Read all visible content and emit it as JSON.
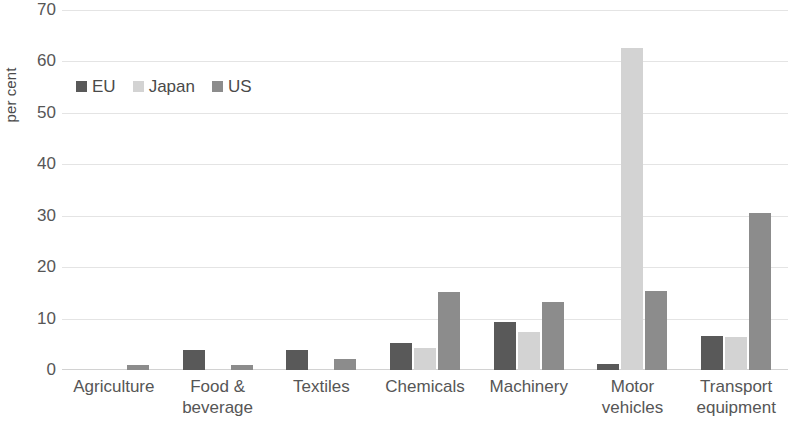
{
  "chart_data": {
    "type": "bar",
    "title": "",
    "subtitle": "",
    "xlabel": "",
    "ylabel": "per cent",
    "ylim": [
      0,
      70
    ],
    "ytick_values": [
      70,
      60,
      50,
      40,
      30,
      20,
      10,
      0
    ],
    "ytick_labels": [
      "70",
      "60",
      "50",
      "40",
      "30",
      "20",
      "10",
      "0"
    ],
    "grid": true,
    "grid_axis": "y",
    "legend_position": "top-left",
    "categories": [
      "Agriculture",
      "Food &\nbeverage",
      "Textiles",
      "Chemicals",
      "Machinery",
      "Motor\nvehicles",
      "Transport\nequipment"
    ],
    "category_lines": [
      [
        "Agriculture"
      ],
      [
        "Food &",
        "beverage"
      ],
      [
        "Textiles"
      ],
      [
        "Chemicals"
      ],
      [
        "Machinery"
      ],
      [
        "Motor",
        "vehicles"
      ],
      [
        "Transport",
        "equipment"
      ]
    ],
    "series": [
      {
        "name": "EU",
        "color": "#595959",
        "values": [
          0.0,
          3.9,
          3.9,
          5.3,
          9.4,
          1.2,
          6.6
        ]
      },
      {
        "name": "Japan",
        "color": "#d3d3d3",
        "values": [
          0.0,
          0.0,
          0.0,
          4.3,
          7.3,
          62.7,
          6.4
        ]
      },
      {
        "name": "US",
        "color": "#8c8c8c",
        "values": [
          1.0,
          1.0,
          2.1,
          15.1,
          13.3,
          15.3,
          30.6
        ]
      }
    ]
  },
  "legend": {
    "items": [
      {
        "label": "EU",
        "color": "#595959"
      },
      {
        "label": "Japan",
        "color": "#d3d3d3"
      },
      {
        "label": "US",
        "color": "#8c8c8c"
      }
    ]
  }
}
